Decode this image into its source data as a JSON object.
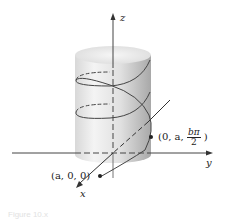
{
  "figure": {
    "axes": {
      "x": "x",
      "y": "y",
      "z": "z"
    },
    "points": [
      {
        "label": "(a, 0, 0)"
      },
      {
        "label_prefix": "(0, a,",
        "frac_num": "bπ",
        "frac_den": "2",
        "label_suffix": ")"
      }
    ],
    "caption": "Figure 10.x",
    "colors": {
      "cylinder_light": "#f0f0f0",
      "cylinder_dark": "#b8b8b8",
      "line": "#333333"
    }
  }
}
